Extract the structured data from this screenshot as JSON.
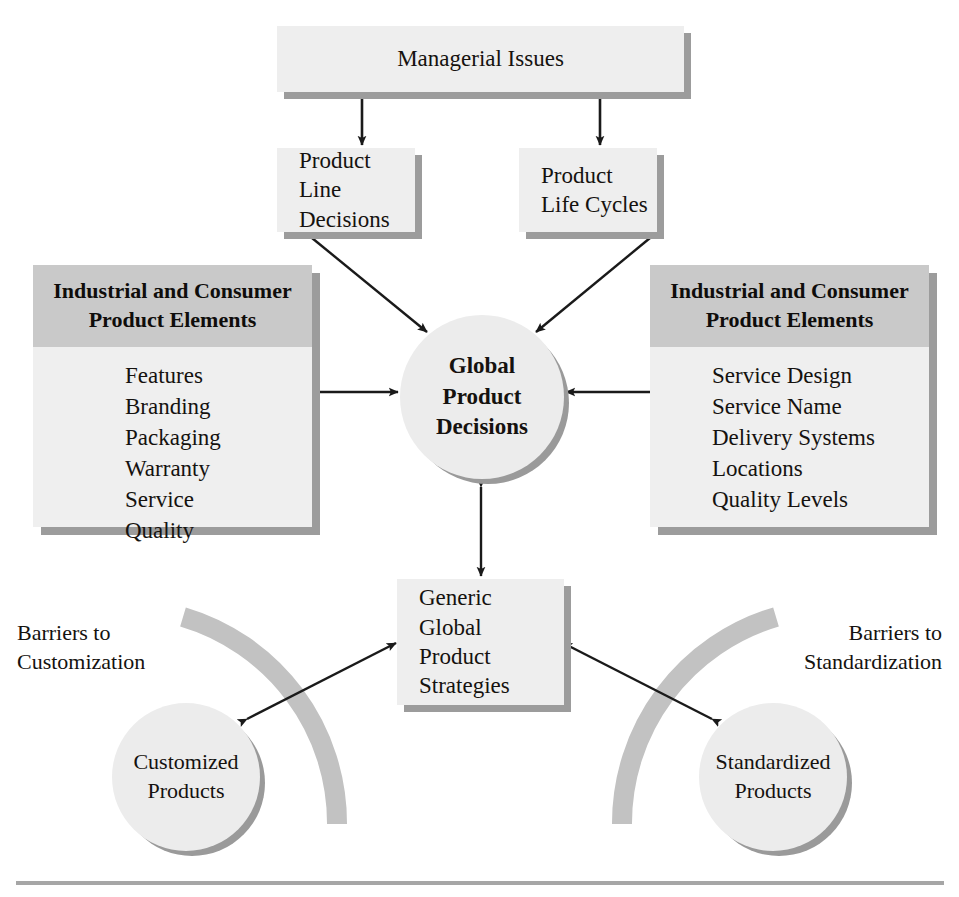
{
  "diagram": {
    "title_box": {
      "label": "Managerial Issues"
    },
    "second_row": [
      {
        "label": "Product\nLine Decisions"
      },
      {
        "label": "Product\nLife Cycles"
      }
    ],
    "left_panel": {
      "header": "Industrial and Consumer\nProduct Elements",
      "items": [
        "Features",
        "Branding",
        "Packaging",
        "Warranty",
        "Service",
        "Quality"
      ]
    },
    "right_panel": {
      "header": "Industrial and Consumer\nProduct Elements",
      "items": [
        "Service Design",
        "Service Name",
        "Delivery Systems",
        "Locations",
        "Quality Levels"
      ]
    },
    "center_circle": {
      "label": "Global\nProduct\nDecisions"
    },
    "strategies_box": {
      "label": "Generic\nGlobal\nProduct\nStrategies"
    },
    "left_caption": {
      "label": "Barriers to\nCustomization"
    },
    "right_caption": {
      "label": "Barriers to\nStandardization"
    },
    "left_circle": {
      "label": "Customized\nProducts"
    },
    "right_circle": {
      "label": "Standardized\nProducts"
    },
    "colors": {
      "box_fill": "#eeeeee",
      "panel_header_fill": "#c9c9c9",
      "panel_body_fill": "#efefef",
      "shadow": "#9c9c9c",
      "arc_band": "#c2c2c2",
      "circle_fill": "#ececec",
      "line": "#1a1a1a",
      "rule": "#a6a6a6",
      "page_background": "#ffffff"
    }
  }
}
